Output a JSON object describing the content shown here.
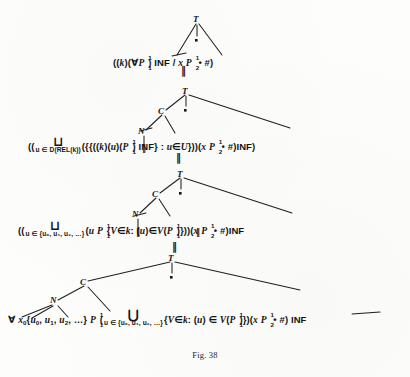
{
  "figure": {
    "caption": "Fig. 38",
    "node_labels": {
      "top": "T",
      "c": "C",
      "n": "N"
    },
    "equals_marker": "‖"
  },
  "levels": [
    {
      "id": "level-1",
      "tree": {
        "root_label": "T",
        "dot": "▪",
        "branches": 3
      },
      "formula_parts": [
        "((",
        "k",
        ")(",
        "∀",
        "P",
        "1",
        "1",
        ") INF / ",
        "x",
        " ",
        "P",
        "2",
        "1",
        " • #)"
      ],
      "formula_text": "((k)(∀ P₁¹) INF / x P₂¹ • #)"
    },
    {
      "id": "level-2",
      "tree": {
        "root_label": "T",
        "c_label": "C",
        "n_label": "N",
        "dot": "▪"
      },
      "formula_text": "((  ⊔ u ∈ D(REL(k)) ({{((k)(u)(P₁¹) INF} : u ∈ U}))(x P₂¹ • #) INF)",
      "bigop_glyph": "⊔",
      "bigop_sub": "u ∈ D(REL(k))"
    },
    {
      "id": "level-3",
      "tree": {
        "root_label": "T",
        "c_label": "C",
        "n_label": "N",
        "dot": "▪"
      },
      "formula_text": "((  ⊔ u ∈ {u₀, u₁, u₂, …} (u  P₁¹{V ∈ k : (u) ∈ V(P₁¹)}))(x P₂¹ • #) INF",
      "bigop_glyph": "⊔",
      "bigop_sub": "u ∈ {u₀, u₁, u₂, …}"
    },
    {
      "id": "level-4",
      "tree": {
        "root_label": "T",
        "c_label": "C",
        "n_label": "N",
        "dot": "▪"
      },
      "formula_text": "∀ x₀{u₀, u₁, u₂, …} P₁¹(  ⋃ u ∈ {u₀, u₁, u₂, …} {V ∈ k : (u) ∈ V(P₁¹)})(x P₂¹ • #) INF",
      "bigop_glyph": "⋃",
      "bigop_sub": "u ∈ {u₀, u₁, u₂, …}"
    }
  ],
  "tokens": {
    "inf": "INF",
    "forall": "∀",
    "hash": "#",
    "bullet": "•",
    "slash": "/",
    "union_big": "⋃",
    "join_big": "⊔",
    "elem": "∈",
    "colon": ":",
    "k": "k",
    "u": "u",
    "U": "U",
    "V": "V",
    "x": "x",
    "D": "D",
    "REL": "REL",
    "P": "P",
    "one": "1",
    "two": "2",
    "sup1": "1",
    "zero": "0",
    "ellipsis": "…",
    "lparen": "(",
    "rparen": ")",
    "lbrace": "{",
    "rbrace": "}",
    "comma": ",",
    "dot_marker": "▪"
  },
  "colors": {
    "ink": "#141414",
    "paper": "#fdfdfc",
    "line": "#1f1f1f"
  }
}
